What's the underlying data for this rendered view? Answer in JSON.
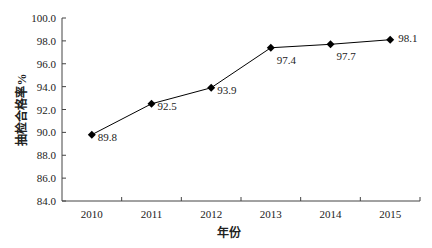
{
  "chart_data": {
    "type": "line",
    "title": "",
    "xlabel": "年份",
    "ylabel": "抽检合格率%",
    "categories": [
      "2010",
      "2011",
      "2012",
      "2013",
      "2014",
      "2015"
    ],
    "series": [
      {
        "name": "抽检合格率",
        "values": [
          89.8,
          92.5,
          93.9,
          97.4,
          97.7,
          98.1
        ],
        "marker": "diamond",
        "color": "#000000"
      }
    ],
    "data_labels": [
      "89.8",
      "92.5",
      "93.9",
      "97.4",
      "97.7",
      "98.1"
    ],
    "ylim": [
      84.0,
      100.0
    ],
    "yticks": [
      "84.0",
      "86.0",
      "88.0",
      "90.0",
      "92.0",
      "94.0",
      "96.0",
      "98.0",
      "100.0"
    ],
    "grid": false,
    "legend": "none"
  }
}
